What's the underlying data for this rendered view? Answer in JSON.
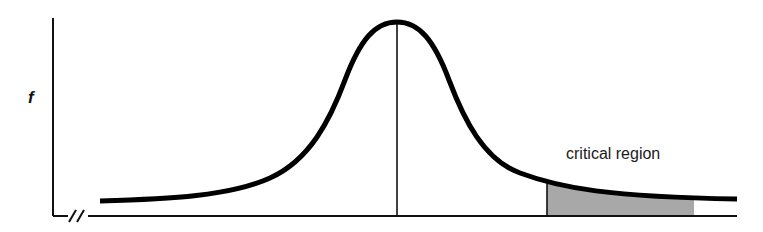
{
  "figure": {
    "type": "normal-distribution-diagram",
    "y_axis_label": "f",
    "x_axis_break": true,
    "annotation": "critical region",
    "colors": {
      "curve": "#000000",
      "axes": "#111111",
      "shaded_region": "#a8a8a8"
    },
    "curve": {
      "shape": "bell",
      "start_px": [
        100,
        201
      ],
      "peak_px": [
        397,
        22
      ],
      "end_px": [
        737,
        199
      ]
    },
    "mean_line_x_px": 397,
    "critical_region": {
      "side": "right-tail",
      "start_x_px": 547,
      "end_x_px": 694
    }
  }
}
